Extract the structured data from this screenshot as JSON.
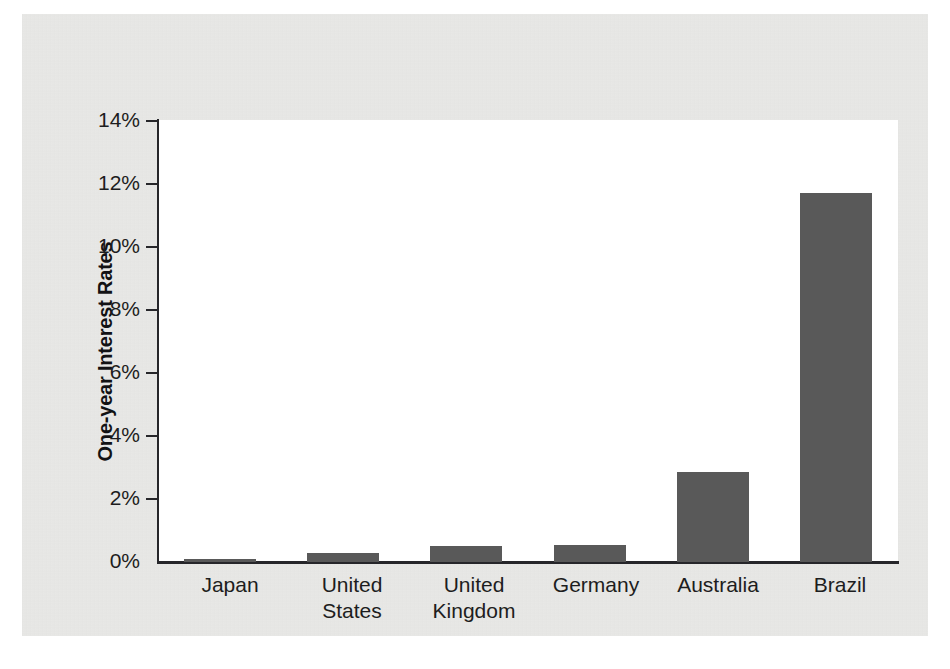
{
  "chart_data": {
    "type": "bar",
    "title": "",
    "xlabel": "",
    "ylabel": "One-year Interest Rates",
    "categories": [
      "Japan",
      "United States",
      "United Kingdom",
      "Germany",
      "Australia",
      "Brazil"
    ],
    "values": [
      0.1,
      0.3,
      0.5,
      0.55,
      2.85,
      11.7
    ],
    "ylim": [
      0,
      14
    ],
    "ytick_labels": [
      "14%",
      "12%",
      "10%",
      "8%",
      "6%",
      "4%",
      "2%",
      "0%"
    ],
    "ytick_values": [
      14,
      12,
      10,
      8,
      6,
      4,
      2,
      0
    ],
    "grid": false,
    "legend": false,
    "bar_color": "#595959",
    "axis_color": "#26262a",
    "plot_background": "#ffffff",
    "page_background": "#e9e9e7"
  },
  "axis": {
    "y_title": "One-year Interest Rates"
  },
  "ticks": {
    "t0": "14%",
    "t1": "12%",
    "t2": "10%",
    "t3": "8%",
    "t4": "6%",
    "t5": "4%",
    "t6": "2%",
    "t7": "0%"
  },
  "categories": {
    "c0": "Japan",
    "c1": "United\nStates",
    "c2": "United\nKingdom",
    "c3": "Germany",
    "c4": "Australia",
    "c5": "Brazil"
  },
  "artifacts": {
    "bleed_center": "Financial Genter M",
    "bleed_top": ""
  }
}
